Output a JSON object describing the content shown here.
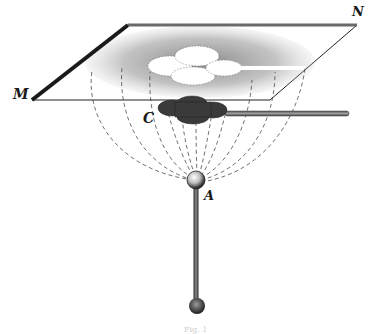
{
  "figure": {
    "labels": {
      "M": "M",
      "N": "N",
      "C": "C",
      "A": "A"
    },
    "caption": "Fig. 1",
    "components": [
      "glass-plate MN",
      "cross-shaped conductor C with handle",
      "charged sphere A on insulating rod",
      "dashed field lines from A to plate",
      "powder figure on plate with clear cross-shaped shadow"
    ],
    "colors": {
      "ink": "#1a1a1a",
      "stipple": "#8a8a8a",
      "conductor": "#3a3a3a",
      "background": "#ffffff"
    }
  }
}
